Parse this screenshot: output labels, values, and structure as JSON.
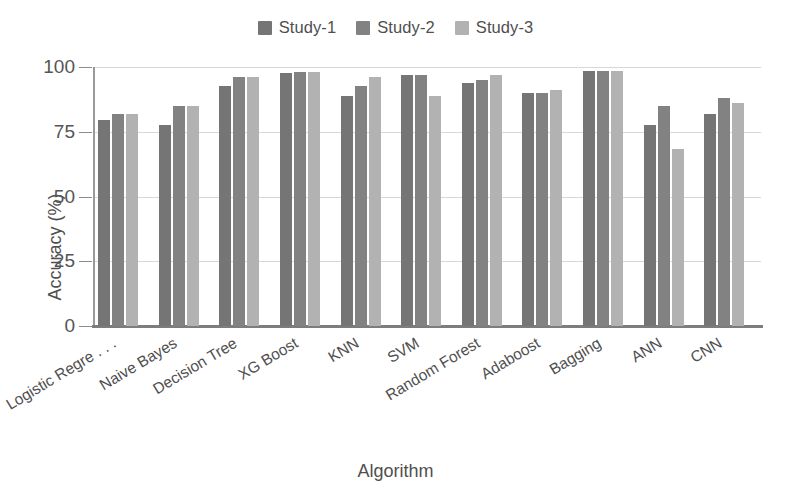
{
  "chart_data": {
    "type": "bar",
    "title": "",
    "subtitle": "",
    "xlabel": "Algorithm",
    "ylabel": "Accuracy (%)",
    "ylim": [
      0,
      100
    ],
    "yticks": [
      0,
      25,
      50,
      75,
      100
    ],
    "ytick_labels": [
      "0",
      "25",
      "50",
      "75",
      "100"
    ],
    "grid": true,
    "legend_position": "top-center",
    "orientation": "vertical",
    "grouped": true,
    "categories": [
      "Logistic Regre . . .",
      "Naive Bayes",
      "Decision Tree",
      "XG Boost",
      "KNN",
      "SVM",
      "Random Forest",
      "Adaboost",
      "Bagging",
      "ANN",
      "CNN"
    ],
    "series": [
      {
        "name": "Study-1",
        "color": "#757575",
        "values": [
          79.5,
          77.5,
          92.5,
          97.5,
          89.0,
          97.0,
          94.0,
          90.0,
          98.5,
          77.5,
          82.0
        ]
      },
      {
        "name": "Study-2",
        "color": "#828282",
        "values": [
          82.0,
          85.0,
          96.0,
          98.0,
          92.5,
          97.0,
          95.0,
          90.0,
          98.5,
          85.0,
          88.0
        ]
      },
      {
        "name": "Study-3",
        "color": "#b2b2b2",
        "values": [
          82.0,
          85.0,
          96.0,
          98.0,
          96.0,
          89.0,
          97.0,
          91.0,
          98.5,
          68.5,
          86.0
        ]
      }
    ]
  },
  "legend": {
    "items": [
      {
        "label": "Study-1",
        "color": "#757575"
      },
      {
        "label": "Study-2",
        "color": "#828282"
      },
      {
        "label": "Study-3",
        "color": "#b2b2b2"
      }
    ]
  },
  "axes": {
    "y_title": "Accuracy (%)",
    "x_title": "Algorithm"
  },
  "colors": {
    "background": "#ffffff",
    "gridline": "#d8d8d8",
    "axis": "#8c8c8c",
    "text": "#4f4f4f"
  }
}
